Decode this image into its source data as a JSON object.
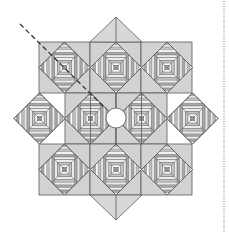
{
  "diagram": {
    "colors": {
      "background_fill": "#d2d2d2",
      "triangle_fill": "#d8d8d8",
      "stripe_dark": "#a9a9a9",
      "stripe_mid": "#c4c4c4",
      "stripe_light": "#ececec",
      "stripe_white": "#ffffff",
      "outline": "#5a5a5a",
      "dashed_line": "#333333",
      "dotted_line": "#777777",
      "center_circle": "#ffffff"
    },
    "block_size": 51,
    "squares": [
      {
        "x": 39,
        "y": 42
      },
      {
        "x": 90,
        "y": 42
      },
      {
        "x": 141,
        "y": 42
      },
      {
        "x": 65,
        "y": 93
      },
      {
        "x": 116,
        "y": 93
      },
      {
        "x": 39,
        "y": 144
      },
      {
        "x": 90,
        "y": 144
      },
      {
        "x": 141,
        "y": 144
      }
    ],
    "edge_squares": [
      {
        "x": 14,
        "y": 93,
        "side": "left"
      },
      {
        "x": 167,
        "y": 93,
        "side": "right"
      }
    ],
    "blocks": [
      {
        "cx": 64.5,
        "cy": 67.5
      },
      {
        "cx": 116,
        "cy": 67.5
      },
      {
        "cx": 167,
        "cy": 67.5
      },
      {
        "cx": 39.5,
        "cy": 118.5
      },
      {
        "cx": 90.5,
        "cy": 118.5
      },
      {
        "cx": 141.5,
        "cy": 118.5
      },
      {
        "cx": 192.5,
        "cy": 118.5
      },
      {
        "cx": 64.5,
        "cy": 169.5
      },
      {
        "cx": 116,
        "cy": 169.5
      },
      {
        "cx": 167,
        "cy": 169.5
      }
    ],
    "top_triangle": {
      "apex": [
        116,
        17
      ],
      "base_left": [
        90,
        42
      ],
      "base_right": [
        142,
        42
      ]
    },
    "bottom_triangle": {
      "apex": [
        116,
        220
      ],
      "base_left": [
        90,
        195
      ],
      "base_right": [
        142,
        195
      ]
    },
    "center_circle": {
      "cx": 116,
      "cy": 118,
      "r": 10
    },
    "cut_line": {
      "x1": 20,
      "y1": 24,
      "x2": 106,
      "y2": 109
    },
    "fold_line": {
      "x": 224,
      "y1": 1,
      "y2": 232
    }
  }
}
